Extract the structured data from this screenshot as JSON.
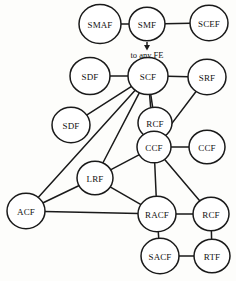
{
  "diagram": {
    "type": "network-graph",
    "width": 236,
    "height": 281,
    "background_color": "#fdfdfb",
    "stroke_color": "#1a1a1a",
    "node_fill_color": "#ffffff",
    "nodes": [
      {
        "id": "smaf",
        "label": "SMAF",
        "cx": 100,
        "cy": 24,
        "r": 21
      },
      {
        "id": "smf",
        "label": "SMF",
        "cx": 147,
        "cy": 24,
        "r": 18
      },
      {
        "id": "scef",
        "label": "SCEF",
        "cx": 209,
        "cy": 23,
        "r": 19
      },
      {
        "id": "sdf_top",
        "label": "SDF",
        "cx": 90,
        "cy": 76,
        "r": 20
      },
      {
        "id": "scf",
        "label": "SCF",
        "cx": 148,
        "cy": 76,
        "r": 20
      },
      {
        "id": "srf",
        "label": "SRF",
        "cx": 207,
        "cy": 77,
        "r": 19
      },
      {
        "id": "sdf_left",
        "label": "SDF",
        "cx": 71,
        "cy": 125,
        "r": 19
      },
      {
        "id": "rcf_mid",
        "label": "RCF",
        "cx": 155,
        "cy": 123,
        "r": 17
      },
      {
        "id": "ccf_mid",
        "label": "CCF",
        "cx": 154,
        "cy": 147,
        "r": 17
      },
      {
        "id": "ccf_right",
        "label": "CCF",
        "cx": 207,
        "cy": 147,
        "r": 18
      },
      {
        "id": "lrf",
        "label": "LRF",
        "cx": 95,
        "cy": 178,
        "r": 18
      },
      {
        "id": "acf",
        "label": "ACF",
        "cx": 26,
        "cy": 211,
        "r": 19
      },
      {
        "id": "racf",
        "label": "RACF",
        "cx": 157,
        "cy": 214,
        "r": 19
      },
      {
        "id": "rcf_right",
        "label": "RCF",
        "cx": 211,
        "cy": 214,
        "r": 18
      },
      {
        "id": "sacf",
        "label": "SACF",
        "cx": 160,
        "cy": 256,
        "r": 19
      },
      {
        "id": "rtf",
        "label": "RTF",
        "cx": 212,
        "cy": 256,
        "r": 18
      }
    ],
    "edges": [
      {
        "from": "smaf",
        "to": "smf"
      },
      {
        "from": "smf",
        "to": "scef"
      },
      {
        "from": "sdf_top",
        "to": "scf"
      },
      {
        "from": "scf",
        "to": "srf"
      },
      {
        "from": "scf",
        "to": "sdf_left"
      },
      {
        "from": "scf",
        "to": "rcf_mid"
      },
      {
        "from": "scf",
        "to": "acf"
      },
      {
        "from": "scf",
        "to": "lrf"
      },
      {
        "from": "scf",
        "to": "ccf_mid"
      },
      {
        "from": "rcf_mid",
        "to": "ccf_mid"
      },
      {
        "from": "srf",
        "to": "ccf_mid"
      },
      {
        "from": "ccf_mid",
        "to": "ccf_right"
      },
      {
        "from": "ccf_mid",
        "to": "lrf"
      },
      {
        "from": "ccf_mid",
        "to": "racf"
      },
      {
        "from": "ccf_mid",
        "to": "rcf_right"
      },
      {
        "from": "lrf",
        "to": "acf"
      },
      {
        "from": "lrf",
        "to": "racf"
      },
      {
        "from": "acf",
        "to": "racf"
      },
      {
        "from": "racf",
        "to": "rcf_right"
      },
      {
        "from": "racf",
        "to": "sacf"
      },
      {
        "from": "sacf",
        "to": "rtf"
      },
      {
        "from": "rcf_right",
        "to": "rtf"
      }
    ],
    "annotations": [
      {
        "id": "to-any-fe",
        "text": "to any FE",
        "x": 147,
        "y": 55,
        "arrow": {
          "x1": 147,
          "y1": 42,
          "x2": 147,
          "y2": 49
        }
      }
    ]
  }
}
